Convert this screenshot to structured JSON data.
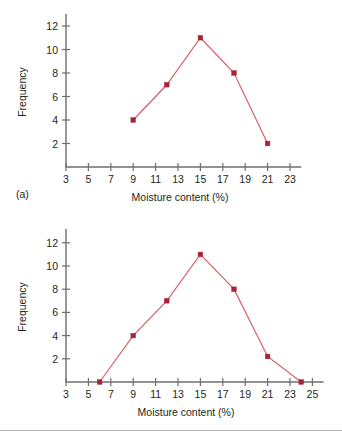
{
  "figure": {
    "background": "#ffffff",
    "rule_color": "#b5b5b5",
    "line_color": "#d4616b",
    "marker_color": "#a82235",
    "axis_color": "#6d6e71"
  },
  "panels": [
    {
      "caption": "(a)",
      "chart_data": {
        "type": "line",
        "title": "",
        "xlabel": "Moisture content (%)",
        "ylabel": "Frequency",
        "xticks": [
          3,
          5,
          7,
          9,
          11,
          13,
          15,
          17,
          19,
          21,
          23
        ],
        "xtick_labels": [
          "3",
          "5",
          "7",
          "9",
          "11",
          "13",
          "15",
          "17",
          "19",
          "21",
          "23"
        ],
        "yticks": [
          2,
          4,
          6,
          8,
          10,
          12
        ],
        "ytick_labels": [
          "2",
          "4",
          "6",
          "8",
          "10",
          "12"
        ],
        "xlim": [
          3,
          24
        ],
        "ylim": [
          0,
          13
        ],
        "grid": false,
        "legend": "none",
        "markers": true,
        "x": [
          9,
          12,
          15,
          18,
          21
        ],
        "values": [
          4,
          7,
          11,
          8,
          2
        ]
      }
    },
    {
      "caption": "(b)",
      "chart_data": {
        "type": "line",
        "title": "",
        "xlabel": "Moisture content (%)",
        "ylabel": "Frequency",
        "xticks": [
          3,
          5,
          7,
          9,
          11,
          13,
          15,
          17,
          19,
          21,
          23,
          25
        ],
        "xtick_labels": [
          "3",
          "5",
          "7",
          "9",
          "11",
          "13",
          "15",
          "17",
          "19",
          "21",
          "23",
          "25"
        ],
        "yticks": [
          2,
          4,
          6,
          8,
          10,
          12
        ],
        "ytick_labels": [
          "2",
          "4",
          "6",
          "8",
          "10",
          "12"
        ],
        "xlim": [
          3,
          26
        ],
        "ylim": [
          0,
          13
        ],
        "grid": false,
        "legend": "none",
        "markers": true,
        "x": [
          6,
          9,
          12,
          15,
          18,
          21,
          24
        ],
        "values": [
          0,
          4,
          7,
          11,
          8,
          2.2,
          0
        ]
      }
    }
  ]
}
